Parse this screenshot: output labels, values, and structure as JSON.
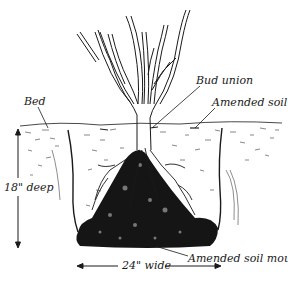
{
  "diagram": {
    "labels": {
      "bud_union": "Bud union",
      "amended_soil": "Amended soil",
      "bed": "Bed",
      "depth": "18\" deep",
      "mound": "Amended soil mound",
      "width": "24\" wide"
    },
    "colors": {
      "ink": "#1a1a1a",
      "mound": "#151515",
      "background": "#ffffff",
      "soil_speckle": "#555555"
    }
  }
}
